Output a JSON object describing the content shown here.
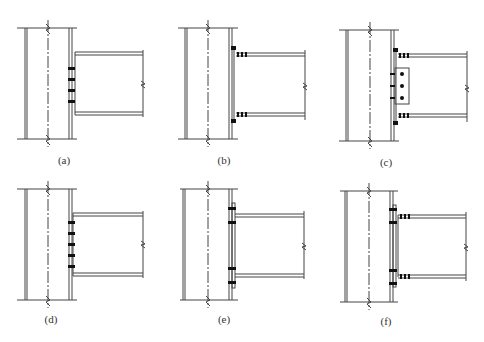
{
  "figure": {
    "line_color": "#444444",
    "bolt_color": "#111111",
    "panels": [
      {
        "id": "a",
        "label": "(a)",
        "type": "shear-tab-bolted-web",
        "bolts": 4
      },
      {
        "id": "b",
        "label": "(b)",
        "type": "flange-plate-bolted",
        "bolts": 0
      },
      {
        "id": "c",
        "label": "(c)",
        "type": "flange-plate-and-web-plate-bolted",
        "bolts": 3
      },
      {
        "id": "d",
        "label": "(d)",
        "type": "end-plate-bolted-web",
        "bolts": 5
      },
      {
        "id": "e",
        "label": "(e)",
        "type": "extended-end-plate",
        "bolts": 4
      },
      {
        "id": "f",
        "label": "(f)",
        "type": "end-plate-with-flange-splice",
        "bolts": 4
      }
    ]
  }
}
